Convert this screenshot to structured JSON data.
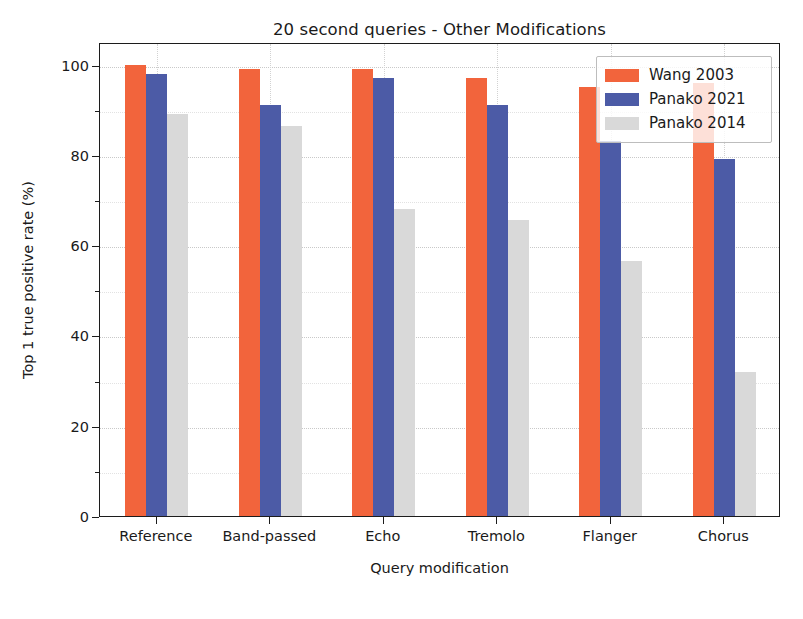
{
  "chart_data": {
    "type": "bar",
    "title": "20 second queries - Other Modifications",
    "xlabel": "Query modification",
    "ylabel": "Top 1 true positive rate (%)",
    "categories": [
      "Reference",
      "Band-passed",
      "Echo",
      "Tremolo",
      "Flanger",
      "Chorus"
    ],
    "series": [
      {
        "name": "Wang 2003",
        "color": "#f2643c",
        "values": [
          100,
          99,
          99,
          97,
          95,
          96
        ]
      },
      {
        "name": "Panako 2021",
        "color": "#4c5ba6",
        "values": [
          98,
          91,
          97,
          91,
          83,
          79
        ]
      },
      {
        "name": "Panako 2014",
        "color": "#d9d9d9",
        "values": [
          89,
          86.5,
          68,
          65.5,
          56.5,
          32
        ]
      }
    ],
    "ylim": [
      0,
      105
    ],
    "yticks": [
      0,
      20,
      40,
      60,
      80,
      100
    ],
    "yticklabels": [
      "0",
      "20",
      "40",
      "60",
      "80",
      "100"
    ],
    "yminorticks": [
      10,
      30,
      50,
      70,
      90
    ],
    "grid": true,
    "legend_position": "upper right",
    "legend_entries": [
      "Wang 2003",
      "Panako 2021",
      "Panako 2014"
    ]
  }
}
